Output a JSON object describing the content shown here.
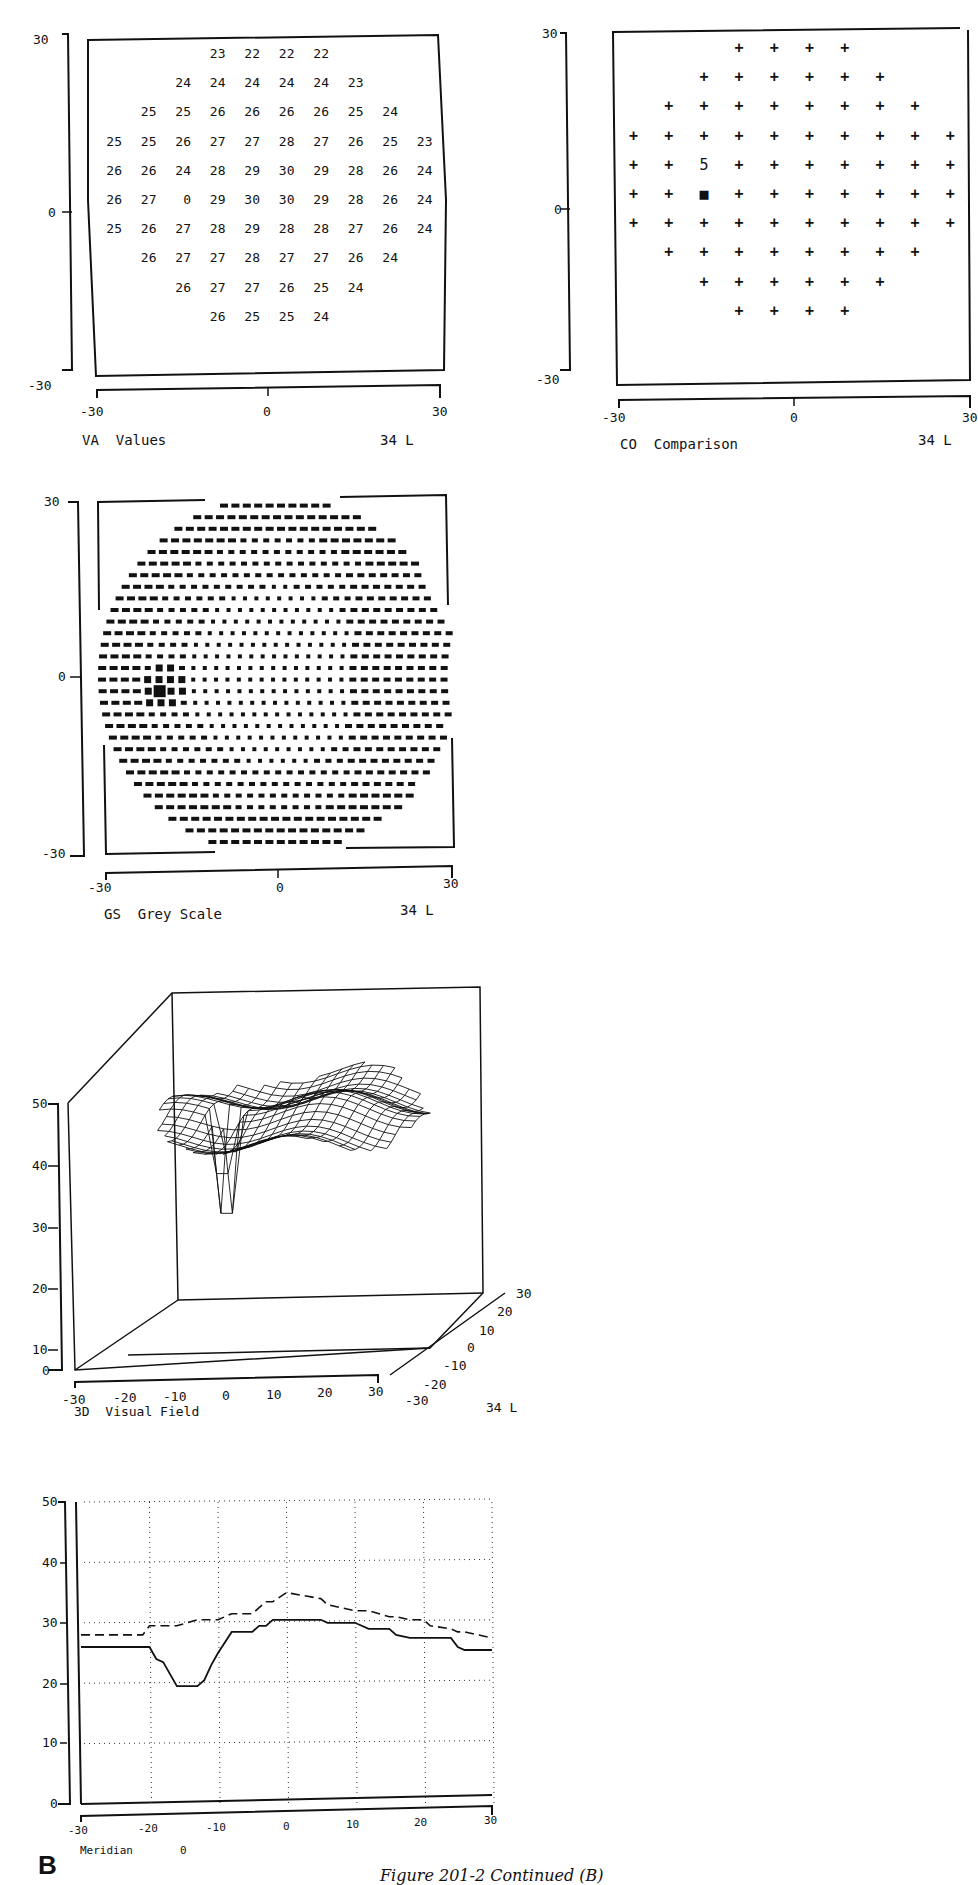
{
  "figure": {
    "panel_letter": "B",
    "caption": "Figure 201-2 Continued (B)"
  },
  "chart_data": [
    {
      "id": "va",
      "type": "table",
      "title": "VA  Values",
      "eye": "34 L",
      "xlim": [
        -30,
        30
      ],
      "ylim": [
        -30,
        30
      ],
      "x_ticks": [
        "-30",
        "0",
        "30"
      ],
      "y_ticks": [
        "30",
        "0",
        "-30"
      ],
      "rows": [
        {
          "offset": 3,
          "values": [
            23,
            22,
            22,
            22
          ]
        },
        {
          "offset": 2,
          "values": [
            24,
            24,
            24,
            24,
            24,
            23
          ]
        },
        {
          "offset": 1,
          "values": [
            25,
            25,
            26,
            26,
            26,
            26,
            25,
            24
          ]
        },
        {
          "offset": 0,
          "values": [
            25,
            25,
            26,
            27,
            27,
            28,
            27,
            26,
            25,
            23
          ]
        },
        {
          "offset": 0,
          "values": [
            26,
            26,
            24,
            28,
            29,
            30,
            29,
            28,
            26,
            24
          ]
        },
        {
          "offset": 0,
          "values": [
            26,
            27,
            0,
            29,
            30,
            30,
            29,
            28,
            26,
            24
          ]
        },
        {
          "offset": 0,
          "values": [
            25,
            26,
            27,
            28,
            29,
            28,
            28,
            27,
            26,
            24
          ]
        },
        {
          "offset": 1,
          "values": [
            26,
            27,
            27,
            28,
            27,
            27,
            26,
            24
          ]
        },
        {
          "offset": 2,
          "values": [
            26,
            27,
            27,
            26,
            25,
            24
          ]
        },
        {
          "offset": 3,
          "values": [
            26,
            25,
            25,
            24
          ]
        }
      ]
    },
    {
      "id": "co",
      "type": "scatter",
      "title": "CO  Comparison",
      "eye": "34 L",
      "xlim": [
        -30,
        30
      ],
      "ylim": [
        -30,
        30
      ],
      "x_ticks": [
        "-30",
        "0",
        "30"
      ],
      "y_ticks": [
        "30",
        "0",
        "-30"
      ],
      "legend": {
        "+": "normal",
        "5": "relative defect (5 dB)",
        "■": "absolute defect"
      },
      "rows": [
        {
          "offset": 3,
          "symbols": [
            "+",
            "+",
            "+",
            "+"
          ]
        },
        {
          "offset": 2,
          "symbols": [
            "+",
            "+",
            "+",
            "+",
            "+",
            "+"
          ]
        },
        {
          "offset": 1,
          "symbols": [
            "+",
            "+",
            "+",
            "+",
            "+",
            "+",
            "+",
            "+"
          ]
        },
        {
          "offset": 0,
          "symbols": [
            "+",
            "+",
            "+",
            "+",
            "+",
            "+",
            "+",
            "+",
            "+",
            "+"
          ]
        },
        {
          "offset": 0,
          "symbols": [
            "+",
            "+",
            "5",
            "+",
            "+",
            "+",
            "+",
            "+",
            "+",
            "+"
          ]
        },
        {
          "offset": 0,
          "symbols": [
            "+",
            "+",
            "■",
            "+",
            "+",
            "+",
            "+",
            "+",
            "+",
            "+"
          ]
        },
        {
          "offset": 0,
          "symbols": [
            "+",
            "+",
            "+",
            "+",
            "+",
            "+",
            "+",
            "+",
            "+",
            "+"
          ]
        },
        {
          "offset": 1,
          "symbols": [
            "+",
            "+",
            "+",
            "+",
            "+",
            "+",
            "+",
            "+"
          ]
        },
        {
          "offset": 2,
          "symbols": [
            "+",
            "+",
            "+",
            "+",
            "+",
            "+"
          ]
        },
        {
          "offset": 3,
          "symbols": [
            "+",
            "+",
            "+",
            "+"
          ]
        }
      ]
    },
    {
      "id": "gs",
      "type": "heatmap",
      "title": "GS  Grey Scale",
      "eye": "34 L",
      "xlim": [
        -30,
        30
      ],
      "ylim": [
        -30,
        30
      ],
      "x_ticks": [
        "-30",
        "0",
        "30"
      ],
      "y_ticks": [
        "30",
        "0",
        "-30"
      ],
      "grid_rows": 31,
      "scotoma_center": {
        "x": -15,
        "y": -3
      }
    },
    {
      "id": "3d",
      "type": "surface",
      "title": "3D  Visual Field",
      "eye": "34 L",
      "x_ticks": [
        "-30",
        "-20",
        "-10",
        "0",
        "10",
        "20",
        "30"
      ],
      "y_ticks": [
        "30",
        "20",
        "10",
        "0",
        "-10",
        "-20",
        "-30"
      ],
      "z_ticks": [
        "0",
        "10",
        "20",
        "30",
        "40",
        "50"
      ],
      "zlim": [
        0,
        50
      ],
      "plateau_level": 32,
      "pit": {
        "x": -15,
        "y": -3,
        "z": 8
      }
    },
    {
      "id": "meridian",
      "type": "line",
      "title": "Meridian",
      "meridian_value": "0",
      "xlim": [
        -30,
        30
      ],
      "ylim": [
        0,
        50
      ],
      "grid": true,
      "x_ticks": [
        "-30",
        "-20",
        "-10",
        "0",
        "10",
        "20",
        "30"
      ],
      "y_ticks": [
        "50",
        "40",
        "30",
        "20",
        "10",
        "0"
      ],
      "x": [
        -30,
        -21,
        -20,
        -19,
        -18,
        -16,
        -13,
        -12,
        -11,
        -10,
        -8,
        -5,
        -4,
        -3,
        -2,
        0,
        5,
        6,
        10,
        12,
        15,
        16,
        18,
        20,
        21,
        24,
        25,
        26,
        30
      ],
      "series": [
        {
          "name": "measured",
          "style": "solid",
          "values": [
            26,
            26,
            26,
            24,
            23.5,
            19.5,
            19.5,
            20.5,
            23,
            25,
            28.5,
            28.5,
            29.5,
            29.5,
            30.5,
            30.5,
            30.5,
            30,
            30,
            29,
            29,
            28,
            27.5,
            27.5,
            27.5,
            27.5,
            26,
            25.5,
            25.5
          ]
        },
        {
          "name": "normal",
          "style": "dashed",
          "values": [
            28,
            28,
            29.5,
            29.5,
            29.5,
            29.5,
            30.5,
            30.5,
            30.5,
            30.5,
            31.5,
            31.5,
            32.5,
            33.5,
            33.5,
            35,
            34,
            33,
            32,
            32,
            31,
            31,
            30.5,
            30.5,
            29.5,
            29,
            28.5,
            28.5,
            27.5
          ]
        }
      ]
    }
  ]
}
